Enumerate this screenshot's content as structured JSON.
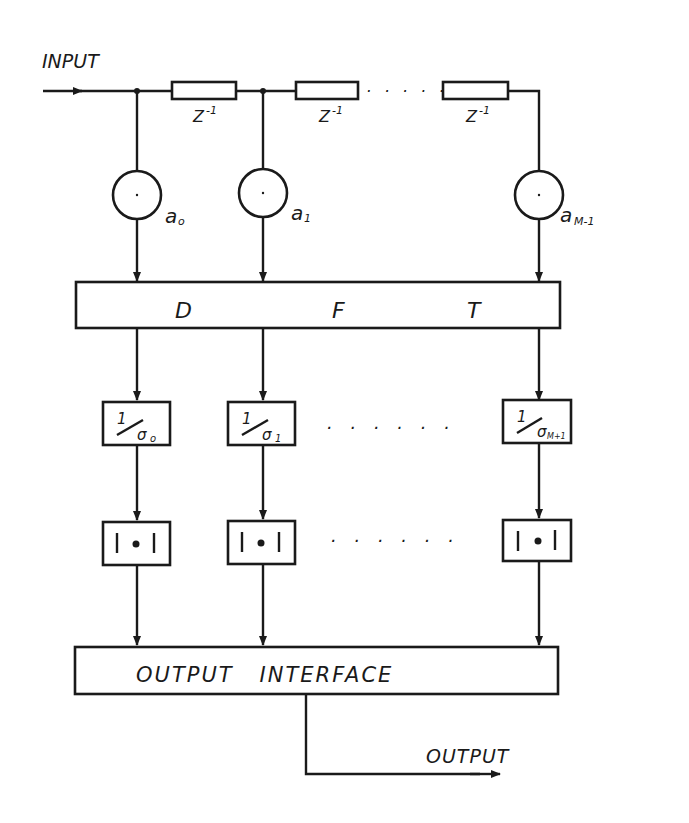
{
  "diagram": {
    "input_label": "INPUT",
    "output_label": "OUTPUT",
    "delay_label": "Z",
    "delay_exp": "-1",
    "multipliers": [
      {
        "label": "a",
        "sub": "o"
      },
      {
        "label": "a",
        "sub": "1"
      },
      {
        "label": "a",
        "sub": "M-1"
      }
    ],
    "dft": {
      "letters": [
        "D",
        "F",
        "T"
      ]
    },
    "normalizers": [
      {
        "num": "1",
        "den": "σ",
        "sub": "o"
      },
      {
        "num": "1",
        "den": "σ",
        "sub": "1"
      },
      {
        "num": "1",
        "den": "σ",
        "sub": "M+1"
      }
    ],
    "magnitude_symbol": "|•|",
    "output_interface": "OUTPUT   INTERFACE",
    "ellipsis": "· · · · · ·"
  }
}
